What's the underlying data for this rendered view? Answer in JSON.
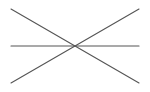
{
  "canvas": {
    "width": 150,
    "height": 92,
    "background": "#ffffff"
  },
  "stroke": {
    "color": "#555555",
    "width": 1.1
  },
  "lines": [
    {
      "name": "descending-diagonal-line",
      "x1": 11,
      "y1": 9,
      "x2": 139,
      "y2": 83
    },
    {
      "name": "ascending-diagonal-line",
      "x1": 11,
      "y1": 83,
      "x2": 139,
      "y2": 9
    },
    {
      "name": "horizontal-line",
      "x1": 11,
      "y1": 46,
      "x2": 139,
      "y2": 46
    }
  ],
  "intersection": {
    "x": 74,
    "y": 46
  }
}
